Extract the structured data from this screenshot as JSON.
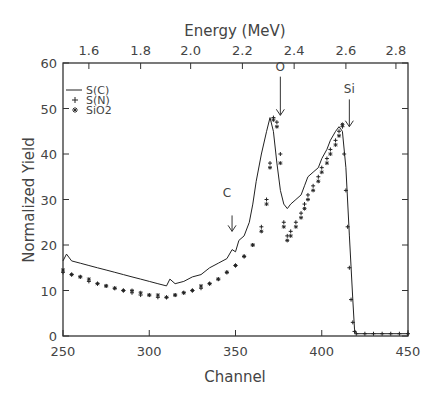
{
  "chart_data": {
    "type": "line",
    "title": "",
    "xlabel": "Channel",
    "ylabel": "Normalized Yield",
    "x2label": "Energy (MeV)",
    "xlim": [
      250,
      450
    ],
    "ylim": [
      0,
      60
    ],
    "xticks": [
      250,
      300,
      350,
      400,
      450
    ],
    "yticks": [
      0,
      10,
      20,
      30,
      40,
      50,
      60
    ],
    "x2ticks": [
      {
        "label": "1.6",
        "channel": 265
      },
      {
        "label": "1.8",
        "channel": 295
      },
      {
        "label": "2.0",
        "channel": 324
      },
      {
        "label": "2.2",
        "channel": 354
      },
      {
        "label": "2.4",
        "channel": 384
      },
      {
        "label": "2.6",
        "channel": 414
      },
      {
        "label": "2.8",
        "channel": 443
      }
    ],
    "grid": false,
    "legend": {
      "position": "upper-left",
      "entries": [
        {
          "label": "S(C)",
          "marker": "line"
        },
        {
          "label": "S(N)",
          "marker": "+"
        },
        {
          "label": "SiO2",
          "marker": "*"
        }
      ]
    },
    "annotations": [
      {
        "text": "O",
        "channel": 376,
        "arrow_from": 57,
        "arrow_to": 48.5
      },
      {
        "text": "Si",
        "channel": 416,
        "arrow_from": 52,
        "arrow_to": 46
      },
      {
        "text": "C",
        "channel": 348,
        "arrow_from": 28,
        "arrow_to": 23
      }
    ],
    "series": [
      {
        "name": "S(C)",
        "style": "line",
        "x": [
          250,
          252,
          255,
          260,
          265,
          270,
          275,
          280,
          285,
          290,
          295,
          300,
          305,
          310,
          312,
          315,
          320,
          325,
          330,
          335,
          340,
          345,
          348,
          350,
          352,
          355,
          358,
          360,
          362,
          365,
          368,
          370,
          372,
          374,
          376,
          378,
          380,
          382,
          385,
          388,
          390,
          392,
          395,
          398,
          400,
          403,
          405,
          408,
          410,
          412,
          414,
          416,
          418,
          419,
          420,
          425,
          430,
          435,
          440,
          445,
          450
        ],
        "y": [
          16.5,
          18,
          16.5,
          16,
          15.5,
          15,
          14.5,
          14,
          13.5,
          13,
          12.5,
          12,
          11.5,
          11,
          12.5,
          11.5,
          12,
          13,
          13.5,
          15,
          16,
          17,
          19,
          18.5,
          21,
          22,
          25,
          29,
          34,
          40,
          45,
          48,
          45,
          38,
          32,
          29,
          28,
          29,
          30,
          31,
          33,
          35,
          36,
          37,
          39,
          41,
          43,
          45,
          46,
          45,
          37,
          22,
          8,
          1.5,
          0.5,
          0.5,
          0.5,
          0.5,
          0.5,
          0.5,
          0.5
        ]
      },
      {
        "name": "S(N)",
        "style": "plus",
        "x": [
          250,
          255,
          260,
          265,
          270,
          275,
          280,
          285,
          290,
          295,
          300,
          305,
          310,
          315,
          320,
          325,
          330,
          335,
          340,
          345,
          350,
          355,
          360,
          365,
          368,
          370,
          372,
          374,
          376,
          378,
          380,
          382,
          385,
          388,
          390,
          392,
          395,
          398,
          400,
          403,
          405,
          408,
          410,
          412,
          413,
          414,
          415,
          416,
          417,
          418,
          419,
          420,
          425,
          430,
          435,
          440,
          445,
          450
        ],
        "y": [
          14,
          13.5,
          13,
          12,
          11.5,
          11,
          10.5,
          10,
          9.5,
          9,
          9,
          8.5,
          8.5,
          9,
          9.5,
          10,
          10.5,
          11.5,
          12.5,
          14,
          15.5,
          17.5,
          20,
          24,
          30,
          38,
          48,
          47,
          40,
          25,
          22,
          23,
          25,
          27,
          29,
          31,
          33,
          35,
          37,
          39,
          41,
          43,
          45,
          46,
          40,
          32,
          24,
          15,
          8,
          3,
          1,
          0.5,
          0.5,
          0.5,
          0.5,
          0.5,
          0.5,
          0.5
        ]
      },
      {
        "name": "SiO2",
        "style": "asterisk",
        "x": [
          250,
          255,
          260,
          265,
          270,
          275,
          280,
          285,
          290,
          295,
          300,
          305,
          310,
          315,
          320,
          325,
          330,
          335,
          340,
          345,
          350,
          355,
          360,
          365,
          368,
          370,
          372,
          374,
          376,
          378,
          380,
          382,
          385,
          388,
          390,
          392,
          395,
          398,
          400,
          403,
          405,
          408,
          410,
          412
        ],
        "y": [
          14.5,
          13.5,
          13,
          12.5,
          11.5,
          11,
          10.5,
          10,
          10,
          9.5,
          9,
          9,
          8.5,
          9,
          9.5,
          10,
          11,
          11.5,
          12.5,
          14,
          15.5,
          17.5,
          20,
          23,
          29,
          37,
          47.5,
          46,
          38,
          24,
          21,
          22,
          24,
          26,
          28,
          30,
          32,
          34,
          36,
          38,
          40,
          42,
          44,
          46.5
        ]
      }
    ]
  }
}
